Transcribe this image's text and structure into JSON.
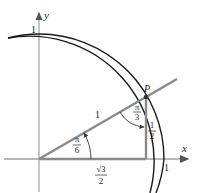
{
  "diagram": {
    "axes": {
      "x_label": "x",
      "y_label": "y",
      "x_tick_label": "1",
      "y_tick_label": "1"
    },
    "point": {
      "label": "P"
    },
    "hypotenuse_label": "1",
    "angle_at_origin": {
      "numerator": "π",
      "denominator": "6"
    },
    "angle_at_P": {
      "numerator": "π",
      "denominator": "3"
    },
    "vertical_leg": {
      "numerator": "1",
      "denominator": "2"
    },
    "horizontal_leg": {
      "numerator": "√3",
      "denominator": "2"
    },
    "colors": {
      "triangle": "#8a8a8a",
      "circle": "#1a1a1a",
      "axes": "#9a9a9a",
      "text": "#222222"
    }
  }
}
